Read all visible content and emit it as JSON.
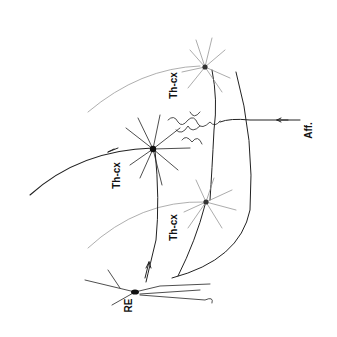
{
  "diagram": {
    "labels": {
      "thcx_top": "Th-cx",
      "thcx_middle": "Th-cx",
      "thcx_bottom": "Th-cx",
      "re": "RE",
      "aff": "Aff."
    },
    "colors": {
      "ink": "#111111",
      "faint": "#8a8a8a",
      "background": "#ffffff"
    },
    "nodes": [
      {
        "id": "thcx_top",
        "type": "thalamocortical neuron"
      },
      {
        "id": "thcx_middle",
        "type": "thalamocortical neuron"
      },
      {
        "id": "thcx_bottom",
        "type": "thalamocortical neuron"
      },
      {
        "id": "re",
        "type": "reticular neuron"
      }
    ],
    "edges": [
      {
        "from": "aff",
        "to": "thcx_middle",
        "label": "afferent input"
      },
      {
        "from": "thcx_middle",
        "to": "cortex",
        "arrow": "outgoing"
      },
      {
        "from": "re",
        "to": "thcx",
        "arrow": "outgoing"
      }
    ]
  }
}
